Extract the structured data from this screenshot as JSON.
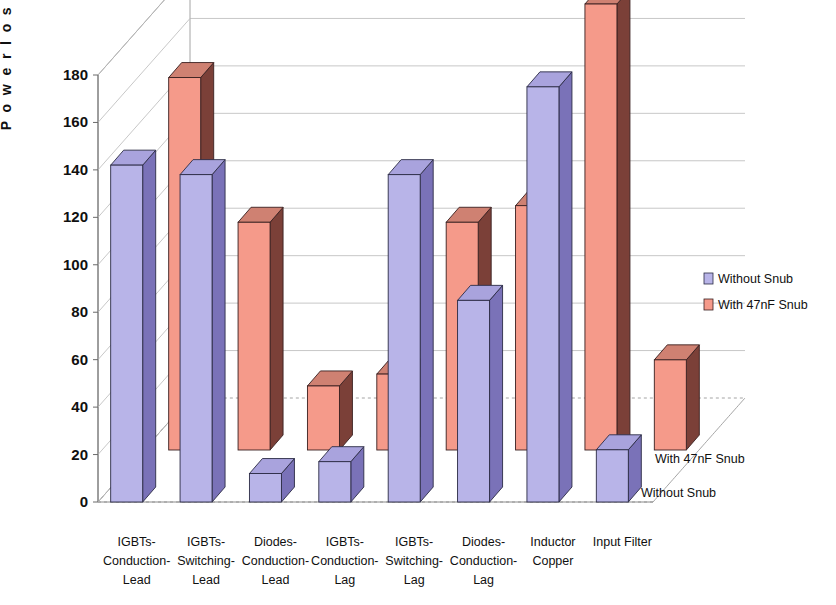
{
  "chart_data": {
    "type": "bar",
    "subtype": "3d-grouped-bar",
    "title": "",
    "xlabel": "",
    "ylabel": "P o w e r   l o s s   ( W )",
    "ylim": [
      0,
      180
    ],
    "ytick_step": 20,
    "yticks": [
      "0",
      "20",
      "40",
      "60",
      "80",
      "100",
      "120",
      "140",
      "160",
      "180"
    ],
    "grid": true,
    "legend_position": "right",
    "categories": [
      "IGBTs-Conduction-Lead",
      "IGBTs-Switching-Lead",
      "Diodes-Conduction-Lead",
      "IGBTs-Conduction-Lag",
      "IGBTs-Switching-Lag",
      "Diodes-Conduction-Lag",
      "Inductor Copper",
      "Input Filter"
    ],
    "category_lines": [
      [
        "IGBTs-",
        "Conduction-",
        "Lead"
      ],
      [
        "IGBTs-",
        "Switching-",
        "Lead"
      ],
      [
        "Diodes-",
        "Conduction-",
        "Lead"
      ],
      [
        "IGBTs-",
        "Conduction-",
        "Lag"
      ],
      [
        "IGBTs-",
        "Switching-",
        "Lag"
      ],
      [
        "Diodes-",
        "Conduction-",
        "Lag"
      ],
      [
        "Inductor",
        "Copper",
        ""
      ],
      [
        "Input Filter",
        "",
        ""
      ]
    ],
    "series": [
      {
        "name": "Without Snub",
        "values": [
          142,
          138,
          12,
          17,
          138,
          85,
          175,
          22
        ]
      },
      {
        "name": "With 47nF Snub",
        "values": [
          157,
          96,
          27,
          32,
          96,
          103,
          188,
          38
        ]
      }
    ],
    "depth_axis_labels": [
      "With 47nF Snub",
      "Without Snub"
    ]
  },
  "legend": {
    "items": [
      {
        "label": "Without Snub",
        "color": "#b8b4e8"
      },
      {
        "label": "With 47nF Snub",
        "color": "#f59a8a"
      }
    ]
  },
  "colors": {
    "front_series1": "#b8b4e8",
    "side_series1": "#7a72b8",
    "top_series1": "#a9a3dd",
    "front_series2": "#f59a8a",
    "side_series2": "#7b4038",
    "top_series2": "#cf8172",
    "grid": "#b9b9b9",
    "axis": "#6a6a6a",
    "text": "#101010"
  }
}
